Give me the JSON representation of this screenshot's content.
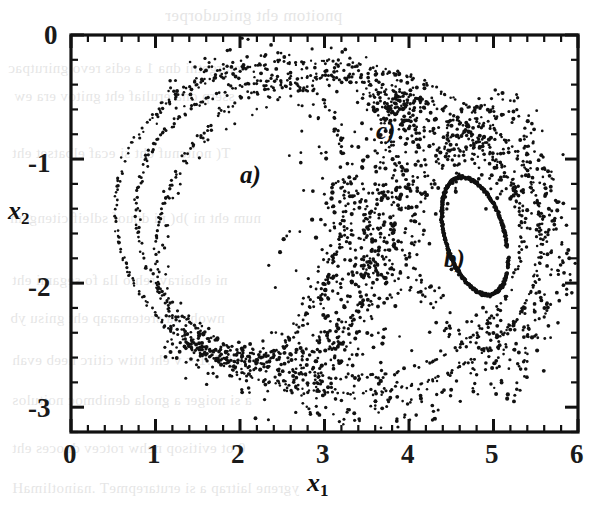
{
  "figure": {
    "kind": "poincare-section",
    "background_color": "#ffffff",
    "ink_color": "#111111"
  },
  "chart_data": {
    "type": "scatter",
    "title": "",
    "xlabel": "x_1",
    "ylabel": "x_2",
    "xlim": [
      0,
      6
    ],
    "ylim": [
      -3.2,
      0
    ],
    "grid": false,
    "legend": null,
    "x_ticks": [
      "0",
      "1",
      "2",
      "3",
      "4",
      "5",
      "6"
    ],
    "x_tick_values": [
      0,
      1,
      2,
      3,
      4,
      5,
      6
    ],
    "y_ticks": [
      "0",
      "-1",
      "-2",
      "-3"
    ],
    "y_tick_values": [
      0,
      -1,
      -2,
      -3
    ],
    "minor_tick_step": 0.2,
    "tick_direction": "in",
    "marker": "dot",
    "marker_color": "#111111",
    "annotations": [
      {
        "id": "a",
        "text": "a)",
        "x": 2.12,
        "y": -1.41,
        "note": "large KAM island / regular region, left"
      },
      {
        "id": "b",
        "text": "b)",
        "x": 4.52,
        "y": -1.86,
        "note": "small KAM island inside right lobe, outlined by a closed invariant curve"
      },
      {
        "id": "c",
        "text": "c)",
        "x": 3.72,
        "y": -0.76,
        "note": "chaotic separatrix layer"
      }
    ],
    "structures": [
      {
        "name": "outer-invariant-curve",
        "kind": "closed-curve-dotted",
        "description": "Outermost dotted invariant curve enclosing the whole section",
        "center": [
          2.95,
          -1.55
        ],
        "approx_extent_x": [
          0.45,
          5.85
        ],
        "approx_extent_y": [
          -3.05,
          -0.05
        ]
      },
      {
        "name": "second-invariant-curve",
        "kind": "closed-curve-dotted",
        "description": "Second dotted invariant curve just inside the outermost one",
        "center": [
          2.95,
          -1.55
        ],
        "approx_extent_x": [
          0.62,
          5.68
        ],
        "approx_extent_y": [
          -2.9,
          -0.22
        ]
      },
      {
        "name": "island-a-boundary",
        "kind": "closed-curve-dotted",
        "description": "Boundary of left regular island labelled a)",
        "center": [
          2.15,
          -1.45
        ],
        "approx_extent_x": [
          0.95,
          3.25
        ],
        "approx_extent_y": [
          -2.55,
          -0.35
        ]
      },
      {
        "name": "island-b-curve",
        "kind": "closed-curve-solid-dashed",
        "description": "Closed invariant curve bounding the small island labelled b)",
        "center": [
          4.78,
          -1.62
        ],
        "semi_major": 0.52,
        "semi_minor": 0.33,
        "tilt_deg": -58
      },
      {
        "name": "chaotic-layer",
        "kind": "point-cloud",
        "description": "Dense stochastic layer along the separatrix crossing the centre of the section, labelled c)",
        "approx_extent_x": [
          2.5,
          4.4
        ],
        "approx_extent_y": [
          -2.9,
          -0.3
        ]
      }
    ]
  }
}
